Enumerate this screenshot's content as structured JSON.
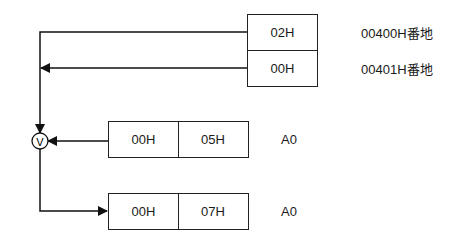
{
  "memory": {
    "cells": [
      {
        "value": "02H",
        "address": "00400H番地"
      },
      {
        "value": "00H",
        "address": "00401H番地"
      }
    ]
  },
  "operand_register": {
    "high": "00H",
    "low": "05H",
    "name": "A0"
  },
  "result_register": {
    "high": "00H",
    "low": "07H",
    "name": "A0"
  },
  "operator": {
    "symbol": "V",
    "meaning": "logical OR"
  }
}
